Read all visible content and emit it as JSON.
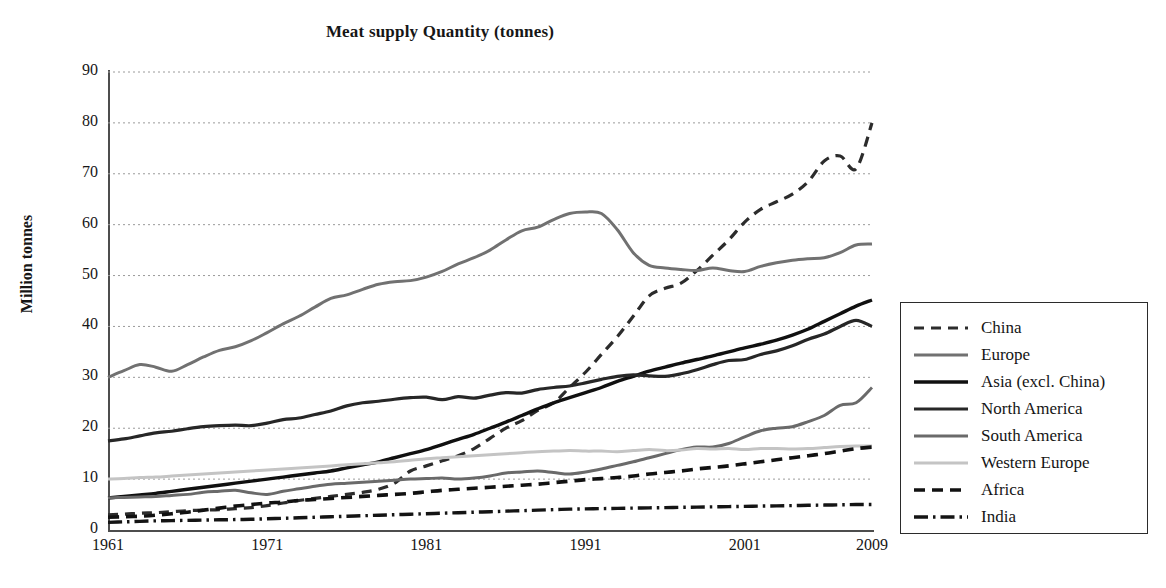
{
  "chart_data": {
    "type": "line",
    "title": "Meat supply Quantity (tonnes)",
    "xlabel": "",
    "ylabel": "Million tonnes",
    "ylim": [
      0,
      90
    ],
    "xlim": [
      1961,
      2009
    ],
    "yticks": [
      "0",
      "10",
      "20",
      "30",
      "40",
      "50",
      "60",
      "70",
      "80",
      "90"
    ],
    "xticks": [
      "1961",
      "1971",
      "1981",
      "1991",
      "2001",
      "2009"
    ],
    "grid": "horizontal-dotted",
    "legend_position": "right-outside",
    "x": [
      1961,
      1962,
      1963,
      1964,
      1965,
      1966,
      1967,
      1968,
      1969,
      1970,
      1971,
      1972,
      1973,
      1974,
      1975,
      1976,
      1977,
      1978,
      1979,
      1980,
      1981,
      1982,
      1983,
      1984,
      1985,
      1986,
      1987,
      1988,
      1989,
      1990,
      1991,
      1992,
      1993,
      1994,
      1995,
      1996,
      1997,
      1998,
      1999,
      2000,
      2001,
      2002,
      2003,
      2004,
      2005,
      2006,
      2007,
      2008,
      2009
    ],
    "series": [
      {
        "name": "China",
        "style": "dashed",
        "color": "#2c2c2c",
        "width": 3.2,
        "values": [
          3.0,
          3.1,
          3.3,
          3.4,
          3.6,
          3.8,
          3.9,
          4.0,
          4.2,
          4.4,
          4.8,
          5.3,
          5.8,
          6.2,
          6.6,
          7.0,
          7.4,
          8.0,
          9.2,
          11.6,
          12.6,
          13.6,
          14.6,
          16.0,
          18.0,
          20.0,
          21.5,
          23.5,
          25.0,
          28.0,
          31.0,
          34.5,
          38.0,
          42.0,
          46.0,
          47.5,
          48.5,
          51.0,
          54.0,
          57.0,
          60.5,
          63.0,
          64.5,
          66.0,
          68.5,
          72.5,
          73.5,
          71.0,
          80.0
        ]
      },
      {
        "name": "Europe",
        "style": "solid",
        "color": "#717171",
        "width": 3.0,
        "values": [
          30.0,
          31.3,
          32.5,
          32.0,
          31.2,
          32.5,
          34.0,
          35.3,
          36.0,
          37.2,
          38.8,
          40.5,
          42.0,
          43.8,
          45.5,
          46.2,
          47.3,
          48.3,
          48.8,
          49.0,
          49.7,
          50.8,
          52.3,
          53.5,
          55.0,
          57.0,
          58.8,
          59.5,
          61.0,
          62.2,
          62.5,
          62.2,
          59.0,
          54.5,
          52.0,
          51.5,
          51.2,
          51.0,
          51.5,
          51.0,
          50.8,
          51.8,
          52.5,
          53.0,
          53.3,
          53.5,
          54.5,
          56.0,
          56.2
        ]
      },
      {
        "name": "Asia (excl. China)",
        "style": "solid",
        "color": "#101010",
        "width": 3.4,
        "values": [
          6.3,
          6.6,
          6.9,
          7.2,
          7.6,
          8.0,
          8.4,
          8.8,
          9.2,
          9.6,
          10.0,
          10.4,
          10.8,
          11.2,
          11.6,
          12.2,
          12.8,
          13.4,
          14.2,
          15.0,
          15.8,
          16.8,
          17.8,
          18.8,
          20.0,
          21.2,
          22.5,
          23.8,
          25.0,
          26.0,
          27.0,
          28.0,
          29.2,
          30.2,
          31.2,
          32.0,
          32.8,
          33.5,
          34.2,
          35.0,
          35.8,
          36.5,
          37.3,
          38.3,
          39.5,
          41.0,
          42.5,
          44.0,
          45.2
        ]
      },
      {
        "name": "North America",
        "style": "solid",
        "color": "#272727",
        "width": 3.2,
        "values": [
          17.5,
          17.9,
          18.5,
          19.1,
          19.4,
          19.9,
          20.3,
          20.5,
          20.6,
          20.5,
          21.0,
          21.7,
          22.0,
          22.7,
          23.4,
          24.4,
          25.0,
          25.3,
          25.7,
          26.0,
          26.1,
          25.6,
          26.2,
          25.9,
          26.5,
          27.0,
          26.9,
          27.6,
          28.0,
          28.3,
          28.9,
          29.6,
          30.2,
          30.5,
          30.3,
          30.2,
          30.7,
          31.5,
          32.5,
          33.3,
          33.5,
          34.5,
          35.2,
          36.2,
          37.5,
          38.5,
          40.0,
          41.2,
          40.0
        ]
      },
      {
        "name": "South America",
        "style": "solid",
        "color": "#6a6a6a",
        "width": 3.0,
        "values": [
          6.3,
          6.4,
          6.5,
          6.6,
          6.8,
          7.0,
          7.4,
          7.6,
          7.8,
          7.3,
          7.0,
          7.6,
          8.1,
          8.6,
          9.0,
          9.2,
          9.4,
          9.6,
          9.8,
          10.0,
          10.1,
          10.2,
          10.0,
          10.2,
          10.6,
          11.2,
          11.4,
          11.6,
          11.3,
          11.0,
          11.4,
          12.0,
          12.7,
          13.4,
          14.2,
          15.0,
          15.8,
          16.3,
          16.3,
          17.0,
          18.3,
          19.5,
          20.0,
          20.3,
          21.3,
          22.5,
          24.5,
          25.0,
          28.0
        ]
      },
      {
        "name": "Western Europe",
        "style": "solid",
        "color": "#c4c4c4",
        "width": 3.0,
        "values": [
          10.0,
          10.1,
          10.3,
          10.4,
          10.6,
          10.8,
          11.0,
          11.2,
          11.4,
          11.6,
          11.8,
          12.0,
          12.2,
          12.4,
          12.6,
          12.8,
          13.0,
          13.2,
          13.4,
          13.7,
          14.0,
          14.2,
          14.4,
          14.6,
          14.8,
          15.0,
          15.2,
          15.4,
          15.5,
          15.6,
          15.5,
          15.5,
          15.4,
          15.6,
          15.8,
          15.6,
          15.7,
          16.0,
          15.9,
          16.0,
          15.8,
          16.0,
          16.0,
          15.9,
          16.0,
          16.2,
          16.4,
          16.5,
          16.5
        ]
      },
      {
        "name": "Africa",
        "style": "dashed",
        "color": "#111111",
        "width": 3.6,
        "values": [
          2.5,
          2.6,
          2.7,
          2.9,
          3.2,
          3.5,
          3.9,
          4.3,
          4.7,
          5.0,
          5.3,
          5.5,
          5.8,
          6.0,
          6.2,
          6.4,
          6.6,
          6.8,
          7.0,
          7.2,
          7.5,
          7.8,
          8.0,
          8.2,
          8.4,
          8.6,
          8.8,
          9.0,
          9.3,
          9.6,
          9.9,
          10.1,
          10.3,
          10.6,
          11.0,
          11.3,
          11.6,
          12.0,
          12.3,
          12.6,
          13.0,
          13.4,
          13.8,
          14.2,
          14.6,
          15.0,
          15.5,
          16.0,
          16.3
        ]
      },
      {
        "name": "India",
        "style": "dashdot",
        "color": "#141414",
        "width": 3.4,
        "values": [
          1.5,
          1.6,
          1.7,
          1.8,
          1.85,
          1.9,
          1.95,
          2.0,
          2.05,
          2.1,
          2.2,
          2.3,
          2.4,
          2.5,
          2.6,
          2.7,
          2.8,
          2.9,
          3.0,
          3.1,
          3.2,
          3.3,
          3.4,
          3.5,
          3.6,
          3.7,
          3.8,
          3.9,
          4.0,
          4.1,
          4.15,
          4.2,
          4.25,
          4.3,
          4.35,
          4.4,
          4.45,
          4.5,
          4.55,
          4.6,
          4.65,
          4.7,
          4.75,
          4.8,
          4.85,
          4.9,
          4.95,
          5.0,
          5.0
        ]
      }
    ]
  },
  "legend": {
    "items": [
      {
        "label": "China"
      },
      {
        "label": "Europe"
      },
      {
        "label": "Asia (excl. China)"
      },
      {
        "label": "North America"
      },
      {
        "label": "South America"
      },
      {
        "label": "Western Europe"
      },
      {
        "label": "Africa"
      },
      {
        "label": "India"
      }
    ]
  }
}
